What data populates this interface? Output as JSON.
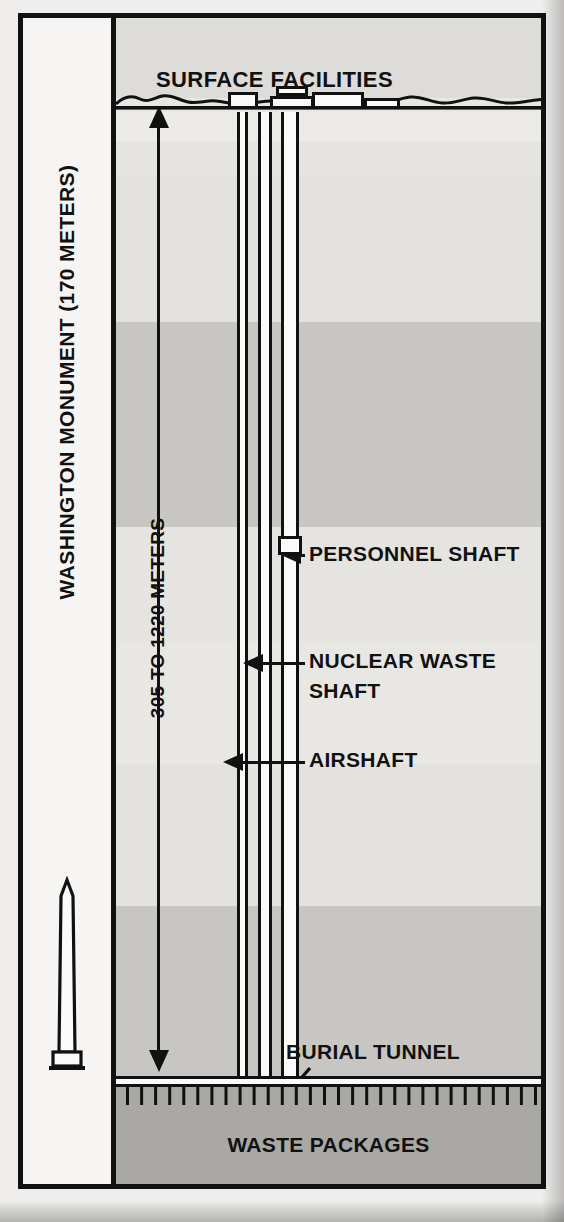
{
  "diagram": {
    "title_surface": "SURFACE FACILITIES",
    "monument_label": "WASHINGTON MONUMENT  (170 METERS)",
    "depth_label": "305 TO 1220 METERS",
    "waste_label": "WASTE PACKAGES",
    "callouts": [
      {
        "id": "personnel-shaft",
        "label": "PERSONNEL SHAFT"
      },
      {
        "id": "nuclear-waste-shaft",
        "label_line1": "NUCLEAR WASTE",
        "label_line2": "SHAFT"
      },
      {
        "id": "airshaft",
        "label": "AIRSHAFT"
      },
      {
        "id": "burial-tunnel",
        "label": "BURIAL TUNNEL"
      }
    ],
    "colors": {
      "ink": "#111111",
      "sky": "#dedcd9",
      "stratum_light": "#e5e3e0",
      "stratum_pale": "#edebe8",
      "stratum_mid": "#c9c7c4",
      "stratum_deep": "#c9c7c4",
      "waste_band": "#aaa8a5",
      "panel": "#f6f5f3",
      "shaft_fill": "#fbfafa"
    },
    "strata": [
      {
        "name": "upper-light",
        "top": 94,
        "height": 30,
        "color": "#ecebe8"
      },
      {
        "name": "upper-pale",
        "top": 124,
        "height": 34,
        "color": "#e6e4e1"
      },
      {
        "name": "upper-band",
        "top": 158,
        "height": 146,
        "color": "#e3e1de"
      },
      {
        "name": "mid-dark",
        "top": 304,
        "height": 205,
        "color": "#c8c6c3"
      },
      {
        "name": "mid-light",
        "top": 509,
        "height": 115,
        "color": "#e6e4e1"
      },
      {
        "name": "mid-pale",
        "top": 624,
        "height": 122,
        "color": "#e9e7e4"
      },
      {
        "name": "lower-light",
        "top": 746,
        "height": 142,
        "color": "#e4e2df"
      },
      {
        "name": "lower-dark",
        "top": 888,
        "height": 218,
        "color": "#c8c6c3"
      }
    ],
    "shafts": [
      {
        "id": "airshaft",
        "left": 121,
        "width": 11,
        "top": 94,
        "bottom_offset": 108
      },
      {
        "id": "personnel-shaft",
        "left": 142,
        "width": 14,
        "top": 94,
        "bottom_offset": 108
      },
      {
        "id": "nuclear-waste-shaft",
        "left": 165,
        "width": 18,
        "top": 94,
        "bottom_offset": 108
      }
    ],
    "surface_buildings": [
      {
        "id": "building-1",
        "left": 112,
        "top": 74,
        "width": 30,
        "height": 17
      },
      {
        "id": "building-2",
        "left": 160,
        "top": 68,
        "width": 32,
        "height": 10
      },
      {
        "id": "building-3",
        "left": 154,
        "top": 78,
        "width": 44,
        "height": 13
      },
      {
        "id": "building-4",
        "left": 196,
        "top": 74,
        "width": 52,
        "height": 17
      },
      {
        "id": "building-5",
        "left": 248,
        "top": 80,
        "width": 36,
        "height": 11
      }
    ],
    "hoist_box": {
      "left": 162,
      "top": 518,
      "width": 24,
      "height": 19
    }
  }
}
